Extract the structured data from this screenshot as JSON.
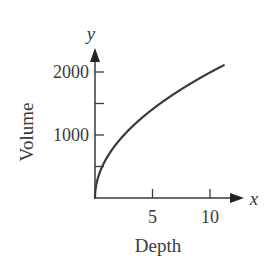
{
  "chart_data": {
    "type": "line",
    "title": "",
    "xlabel": "Depth",
    "ylabel": "Volume",
    "x_axis_symbol": "x",
    "y_axis_symbol": "y",
    "x_ticks": [
      5,
      10
    ],
    "x_tick_labels": [
      "5",
      "10"
    ],
    "y_ticks": [
      500,
      1000,
      1500,
      2000
    ],
    "y_tick_labels": [
      "",
      "1000",
      "",
      "2000"
    ],
    "xlim": [
      0,
      12
    ],
    "ylim": [
      0,
      2400
    ],
    "grid": false,
    "legend": null,
    "series": [
      {
        "name": "Volume vs Depth",
        "x": [
          0,
          0.25,
          0.5,
          1,
          2,
          3,
          4,
          5,
          6,
          7,
          8,
          9,
          10,
          11.2
        ],
        "y": [
          0,
          315,
          445,
          630,
          891,
          1091,
          1260,
          1409,
          1543,
          1667,
          1782,
          1890,
          1992,
          2108
        ]
      }
    ],
    "color": "#3a3a3a"
  }
}
